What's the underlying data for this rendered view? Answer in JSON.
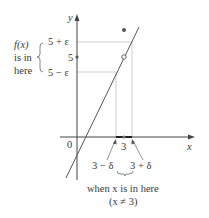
{
  "diagram": {
    "axis_labels": {
      "y": "y",
      "x": "x",
      "origin": "0"
    },
    "y_ticks": {
      "upper": "5 + ε",
      "middle": "5",
      "lower": "5 − ε"
    },
    "x_ticks": {
      "center": "3",
      "left": "3 − δ",
      "right": "3 + δ"
    },
    "left_annotation": {
      "line1": "f(x)",
      "line2": "is in",
      "line3": "here"
    },
    "bottom_annotation": {
      "line1": "when x is in here",
      "line2": "(x ≠ 3)"
    },
    "colors": {
      "axis": "#444444",
      "guide": "#c8c8c8",
      "curve": "#555555",
      "dot": "#555555"
    }
  }
}
